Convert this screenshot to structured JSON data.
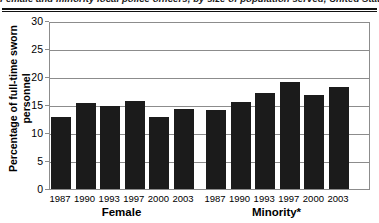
{
  "title": "Female and minority local police officers, by size of population served, United States, 1987-2003",
  "chart_data": {
    "type": "bar",
    "title": "Female and minority local police officers, by size of population served, United States, 1987-2003",
    "xlabel": "",
    "ylabel": "Percentage of full-time sworn personnel",
    "ylim": [
      0,
      30
    ],
    "yticks": [
      0,
      5,
      10,
      15,
      20,
      25,
      30
    ],
    "grid": true,
    "legend": "none",
    "bar_color": "#1b1b1b",
    "groups": [
      {
        "name": "Female",
        "categories": [
          "1987",
          "1990",
          "1993",
          "1997",
          "2000",
          "2003"
        ],
        "values": [
          12.8,
          15.3,
          14.8,
          15.8,
          12.9,
          14.2
        ]
      },
      {
        "name": "Minority*",
        "categories": [
          "1987",
          "1990",
          "1993",
          "1997",
          "2000",
          "2003"
        ],
        "values": [
          14.1,
          15.6,
          17.1,
          19.1,
          16.8,
          18.2
        ]
      }
    ]
  }
}
